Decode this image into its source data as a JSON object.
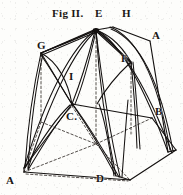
{
  "figure": {
    "title": "Fig II.",
    "caption": "Fig II.",
    "background_color": "#fdfdfb",
    "ink_color": "#1a1614"
  },
  "labels": [
    {
      "id": "E",
      "text": "E",
      "x": 95,
      "y": 8,
      "role": "apex-vertex"
    },
    {
      "id": "H",
      "text": "H",
      "x": 122,
      "y": 8,
      "role": "rear-ridge-vertex"
    },
    {
      "id": "A1",
      "text": "A",
      "x": 152,
      "y": 30,
      "role": "upper-right-vertex"
    },
    {
      "id": "G",
      "text": "G",
      "x": 37,
      "y": 40,
      "role": "upper-left-vertex"
    },
    {
      "id": "F",
      "text": "F",
      "x": 121,
      "y": 53,
      "role": "right-slope-vertex"
    },
    {
      "id": "I",
      "text": "I",
      "x": 69,
      "y": 71,
      "role": "rib-crossing-vertex"
    },
    {
      "id": "B",
      "text": "B",
      "x": 155,
      "y": 106,
      "role": "right-springing-vertex"
    },
    {
      "id": "C",
      "text": "C.",
      "x": 66,
      "y": 111,
      "role": "center-impost-vertex"
    },
    {
      "id": "A2",
      "text": "A",
      "x": 6,
      "y": 175,
      "role": "lower-left-vertex"
    },
    {
      "id": "D",
      "text": "D",
      "x": 96,
      "y": 173,
      "role": "base-center-vertex"
    }
  ],
  "geometry": {
    "solid_ribs": [
      {
        "name": "rib-E-to-left-springing",
        "d": "M 96 30 C 72 46, 46 96, 24 168"
      },
      {
        "name": "rib-E-to-left-springing-b",
        "d": "M 96 31 C 74 48, 49 98, 27 169"
      },
      {
        "name": "rib-E-to-front-pier",
        "d": "M 96 30 C 98 64, 104 120, 116 176"
      },
      {
        "name": "rib-E-to-front-pier-b",
        "d": "M 96 31 C 100 65, 107 121, 120 176"
      },
      {
        "name": "rib-E-to-right-springing",
        "d": "M 97 30 C 122 44, 146 92, 168 152"
      },
      {
        "name": "rib-E-to-right-springing-b",
        "d": "M 97 31 C 124 46, 149 94, 171 153"
      },
      {
        "name": "rib-E-to-G",
        "d": "M 96 30 L 41 53"
      },
      {
        "name": "rib-E-to-G-b",
        "d": "M 96 32 L 42 55"
      },
      {
        "name": "rib-E-to-F",
        "d": "M 97 30 L 131 62"
      },
      {
        "name": "rib-E-to-F-b",
        "d": "M 97 32 L 132 64"
      },
      {
        "name": "rib-E-to-C",
        "d": "M 95 31 C 88 58, 80 84, 72 104"
      },
      {
        "name": "rib-E-to-C-b",
        "d": "M 96 31 C 90 58, 83 85, 75 104"
      },
      {
        "name": "rib-G-to-C-diagonal",
        "d": "M 41 53 C 53 72, 63 90, 72 104"
      },
      {
        "name": "rib-G-to-C-diagonal-b",
        "d": "M 41 55 C 54 74, 64 91, 73 105"
      },
      {
        "name": "rib-C-to-left-base",
        "d": "M 70 105 C 56 118, 40 142, 25 168"
      },
      {
        "name": "rib-C-to-left-base-b",
        "d": "M 71 106 C 58 120, 43 144, 28 169"
      },
      {
        "name": "rib-C-to-front-base",
        "d": "M 73 105 C 86 124, 102 150, 116 176"
      },
      {
        "name": "rib-C-to-front-base-b",
        "d": "M 74 105 C 88 124, 104 150, 119 176"
      },
      {
        "name": "rib-F-to-B-pier",
        "d": "M 131 62 C 134 92, 136 120, 137 148"
      },
      {
        "name": "rib-F-to-B-pier-b",
        "d": "M 133 62 C 136 92, 138 120, 139 148"
      },
      {
        "name": "rib-H-arc-right",
        "d": "M 110 27 C 134 36, 156 72, 170 150"
      },
      {
        "name": "rib-G-arc-left",
        "d": "M 41 53 C 34 84, 28 122, 25 167"
      },
      {
        "name": "rib-web-left-upper",
        "d": "M 41 53 C 58 62, 68 82, 72 104"
      },
      {
        "name": "rib-web-right-upper",
        "d": "M 131 62 C 118 74, 106 88, 97 104"
      }
    ],
    "solid_edges": [
      {
        "name": "edge-E-H-ridge",
        "d": "M 96 30 L 113 27"
      },
      {
        "name": "edge-H-to-A-upper",
        "d": "M 113 27 L 150 41"
      },
      {
        "name": "edge-G-to-E-top",
        "d": "M 41 53 L 96 29"
      },
      {
        "name": "edge-C-to-right-top",
        "d": "M 72 104 L 152 118"
      },
      {
        "name": "edge-base-left-top",
        "d": "M 24 168 L 72 104"
      },
      {
        "name": "edge-base-front",
        "d": "M 24 172 L 130 180"
      },
      {
        "name": "edge-base-right",
        "d": "M 130 180 L 176 150"
      },
      {
        "name": "edge-base-right-upper",
        "d": "M 152 118 L 176 150"
      },
      {
        "name": "edge-left-pier",
        "d": "M 24 168 L 24 172"
      },
      {
        "name": "edge-front-pier",
        "d": "M 117 176 L 130 180"
      },
      {
        "name": "edge-A-to-B-right",
        "d": "M 150 41 L 168 152"
      }
    ],
    "dashed_lines": [
      {
        "name": "hidden-G-vertical",
        "d": "M 41 54 L 41 122"
      },
      {
        "name": "hidden-E-vertical",
        "d": "M 96 32 L 96 144"
      },
      {
        "name": "hidden-F-vertical",
        "d": "M 131 63 L 131 134"
      },
      {
        "name": "hidden-back-left-edge",
        "d": "M 41 122 L 96 144"
      },
      {
        "name": "hidden-back-right-edge",
        "d": "M 96 144 L 152 118"
      },
      {
        "name": "hidden-base-diag-a",
        "d": "M 24 172 L 96 144"
      },
      {
        "name": "hidden-base-diag-b",
        "d": "M 24 172 L 130 180"
      },
      {
        "name": "hidden-base-diag-c",
        "d": "M 96 144 L 130 180"
      },
      {
        "name": "hidden-floor-diag",
        "d": "M 41 122 L 24 172"
      },
      {
        "name": "hidden-C-to-base",
        "d": "M 72 106 L 96 144"
      }
    ]
  }
}
